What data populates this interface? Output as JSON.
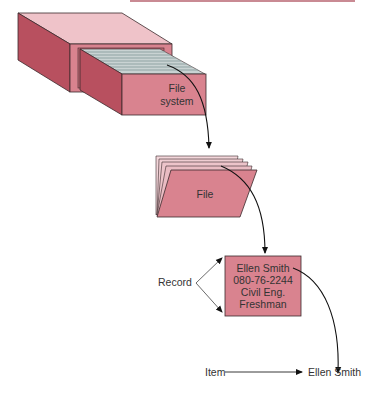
{
  "diagram": {
    "colors": {
      "face_front": "#d9838f",
      "face_side": "#b8505f",
      "face_top": "#efc3c9",
      "outline": "#3a2a2c",
      "card_lines": "#8fa3a3",
      "arrow": "#111111",
      "text": "#333333",
      "header_line": "#c98a93"
    },
    "file_system": {
      "label_line1": "File",
      "label_line2": "system"
    },
    "file": {
      "label": "File"
    },
    "record": {
      "callout_label": "Record",
      "fields": [
        "Ellen Smith",
        "080-76-2244",
        "Civil Eng.",
        "Freshman"
      ]
    },
    "item": {
      "callout_label": "Item",
      "value": "Ellen Smith"
    }
  }
}
